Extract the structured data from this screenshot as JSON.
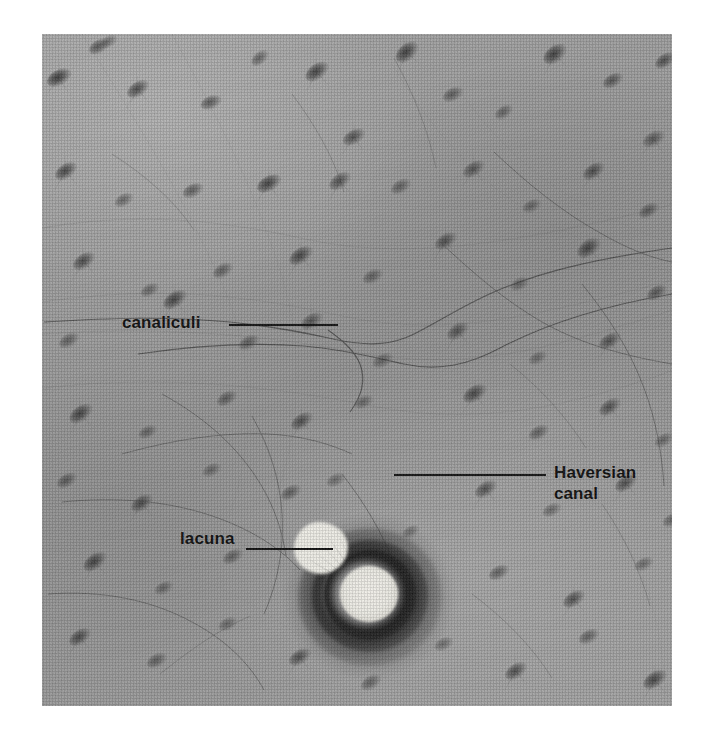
{
  "figure": {
    "kind": "light-micrograph",
    "background_color": "#ffffff",
    "plate_base_color": "#9a9a9a",
    "label_color": "#0b0b0b",
    "leader_color": "#0d0d0d",
    "plate": {
      "left": 42,
      "top": 34,
      "width": 630,
      "height": 672
    }
  },
  "annotations": [
    {
      "id": "canaliculi",
      "label": "canaliculi",
      "lines": [
        "canaliculi"
      ],
      "align": "right",
      "leader": {
        "from_x": 187,
        "to_x": 296,
        "y": 291
      },
      "text_position": {
        "x": 80,
        "y": 278
      }
    },
    {
      "id": "haversian-canal",
      "label": "Haversian canal",
      "lines": [
        "Haversian",
        "canal"
      ],
      "align": "left",
      "leader": {
        "from_x": 352,
        "to_x": 504,
        "y": 441
      },
      "text_position": {
        "x": 512,
        "y": 428
      }
    },
    {
      "id": "lacuna",
      "label": "lacuna",
      "lines": [
        "lacuna"
      ],
      "align": "right",
      "leader": {
        "from_x": 204,
        "to_x": 291,
        "y": 515
      },
      "text_position": {
        "x": 138,
        "y": 494
      }
    }
  ],
  "structures": {
    "osteon": {
      "name": "osteon",
      "center": {
        "x": 328,
        "y": 563
      },
      "canal_core_color": "#efeee7",
      "lamellae_rings": 3,
      "outer_radius": 76
    },
    "lacunae_count": 54
  }
}
